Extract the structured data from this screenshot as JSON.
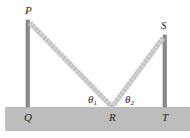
{
  "diagram": {
    "points": {
      "P": "P",
      "Q": "Q",
      "R": "R",
      "S": "S",
      "T": "T"
    },
    "angles": {
      "theta1": "θ",
      "theta1_sub": "1",
      "theta2": "θ",
      "theta2_sub": "2"
    },
    "colors": {
      "ground": "#b9b9b9",
      "pole": "#8f8f8f",
      "path": "#d4d4d4"
    }
  }
}
